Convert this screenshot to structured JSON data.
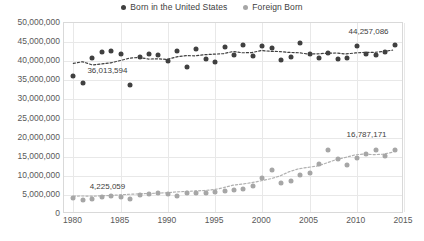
{
  "legend": {
    "position": "top-center",
    "items": [
      {
        "label": "Born in the United States",
        "color": "#404040",
        "marker": "circle"
      },
      {
        "label": "Foreign Born",
        "color": "#a6a6a6",
        "marker": "circle"
      }
    ]
  },
  "annotations": [
    {
      "name": "us-first-label",
      "text": "36,013,594",
      "series": "Born in the United States",
      "year": 1980
    },
    {
      "name": "us-last-label",
      "text": "44,257,086",
      "series": "Born in the United States",
      "year": 2014
    },
    {
      "name": "fb-first-label",
      "text": "4,225,059",
      "series": "Foreign Born",
      "year": 1980
    },
    {
      "name": "fb-last-label",
      "text": "16,787,171",
      "series": "Foreign Born",
      "year": 2014
    }
  ],
  "chart_data": {
    "type": "scatter",
    "title": "",
    "subtitle": "",
    "xlabel": "",
    "ylabel": "",
    "xlim": [
      1979,
      2015
    ],
    "ylim": [
      0,
      50000000
    ],
    "grid": true,
    "legend_position": "top-center",
    "x_ticks": [
      1980,
      1985,
      1990,
      1995,
      2000,
      2005,
      2010,
      2015
    ],
    "y_ticks": [
      0,
      5000000,
      10000000,
      15000000,
      20000000,
      25000000,
      30000000,
      35000000,
      40000000,
      45000000,
      50000000
    ],
    "y_tick_labels": [
      "0",
      "5,000,000",
      "10,000,000",
      "15,000,000",
      "20,000,000",
      "25,000,000",
      "30,000,000",
      "35,000,000",
      "40,000,000",
      "45,000,000",
      "50,000,000"
    ],
    "x": [
      1980,
      1981,
      1982,
      1983,
      1984,
      1985,
      1986,
      1987,
      1988,
      1989,
      1990,
      1991,
      1992,
      1993,
      1994,
      1995,
      1996,
      1997,
      1998,
      1999,
      2000,
      2001,
      2002,
      2003,
      2004,
      2005,
      2006,
      2007,
      2008,
      2009,
      2010,
      2011,
      2012,
      2013,
      2014
    ],
    "series": [
      {
        "name": "Born in the United States",
        "color": "#404040",
        "trendline": true,
        "values": [
          36013594,
          34400000,
          40900000,
          42500000,
          42800000,
          41900000,
          33800000,
          41000000,
          41900000,
          41500000,
          40100000,
          42600000,
          38600000,
          43300000,
          40600000,
          39800000,
          43800000,
          41600000,
          44200000,
          41300000,
          43900000,
          43500000,
          40400000,
          41000000,
          44800000,
          41900000,
          40900000,
          42200000,
          40600000,
          40900000,
          43900000,
          41800000,
          41600000,
          42500000,
          44257086
        ]
      },
      {
        "name": "Foreign Born",
        "color": "#a6a6a6",
        "trendline": true,
        "values": [
          4225059,
          3700000,
          3900000,
          4400000,
          4800000,
          4400000,
          3900000,
          4900000,
          5300000,
          5400000,
          5300000,
          4800000,
          5400000,
          5500000,
          5500000,
          5800000,
          6000000,
          6400000,
          6600000,
          7300000,
          9400000,
          11500000,
          8200000,
          8600000,
          10300000,
          10800000,
          13100000,
          16800000,
          14300000,
          12700000,
          14700000,
          15600000,
          16700000,
          15300000,
          16787171
        ]
      }
    ]
  }
}
